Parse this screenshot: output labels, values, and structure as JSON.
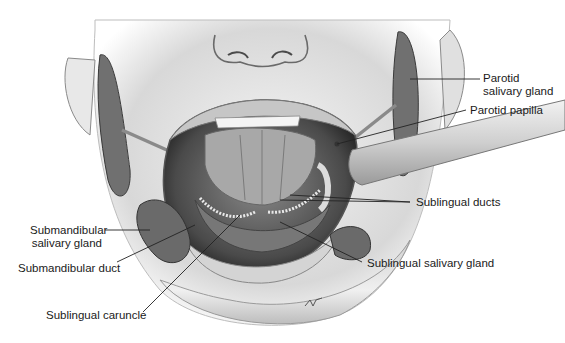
{
  "figure": {
    "labels": {
      "parotid_gland": {
        "line1": "Parotid",
        "line2": "salivary gland"
      },
      "parotid_papilla": "Parotid papilla",
      "sublingual_ducts": "Sublingual ducts",
      "submandibular_gland": {
        "line1": "Submandibular",
        "line2": "salivary gland"
      },
      "submandibular_duct": "Submandibular duct",
      "sublingual_gland": "Sublingual salivary gland",
      "sublingual_caruncle": "Sublingual caruncle"
    },
    "colors": {
      "ink": "#1a1a1a",
      "skin": "#e6e6e6",
      "gland": "#6e6e6e",
      "mouth_dark": "#3a3a3a"
    }
  }
}
